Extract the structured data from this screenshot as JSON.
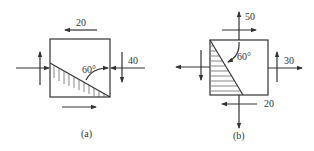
{
  "figures": [
    {
      "id": "a",
      "caption": "(a)",
      "labels": {
        "top_shear": "20",
        "right_normal": "40",
        "angle": "60°"
      }
    },
    {
      "id": "b",
      "caption": "(b)",
      "labels": {
        "top_normal": "50",
        "right_normal": "30",
        "bottom_shear": "20",
        "angle": "60°"
      }
    }
  ],
  "colors": {
    "line": "#333333",
    "background": "#ffffff"
  }
}
